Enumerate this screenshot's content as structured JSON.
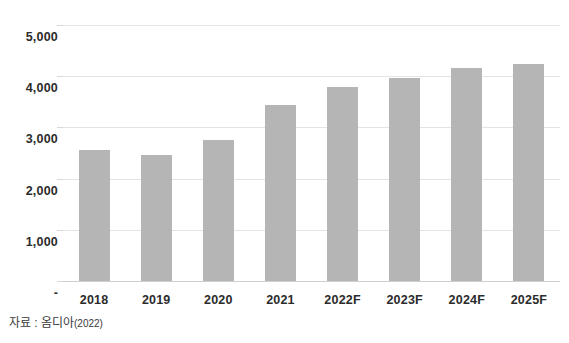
{
  "chart_data": {
    "type": "bar",
    "title": "",
    "xlabel": "",
    "ylabel": "",
    "categories": [
      "2018",
      "2019",
      "2020",
      "2021",
      "2022F",
      "2023F",
      "2024F",
      "2025F"
    ],
    "values": [
      2550,
      2470,
      2750,
      3430,
      3780,
      3960,
      4160,
      4240
    ],
    "series": [
      {
        "name": "",
        "values": [
          2550,
          2470,
          2750,
          3430,
          3780,
          3960,
          4160,
          4240
        ]
      }
    ],
    "ylim": [
      0,
      5000
    ],
    "y_ticks": [
      0,
      1000,
      2000,
      3000,
      4000,
      5000
    ],
    "y_tick_labels": [
      "-",
      "1,000",
      "2,000",
      "3,000",
      "4,000",
      "5,000"
    ],
    "grid": true,
    "legend": false,
    "legend_position": "none",
    "bar_color": "#b5b5b5",
    "gridline_color": "#e4e4e4",
    "axis_text_color": "#2b2b2b"
  },
  "footer": {
    "source_prefix": "자료 : 옴디아",
    "source_year": "(2022)"
  }
}
